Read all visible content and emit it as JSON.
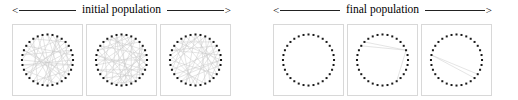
{
  "figure": {
    "width": 518,
    "height": 100,
    "background": "#ffffff",
    "node_color": "#1a1a1a",
    "edge_color": "#c9c9c9",
    "panel_border_color": "#d8d8d8",
    "rule_color": "#222222"
  },
  "groups": [
    {
      "id": "initial",
      "label": "initial population",
      "arrow_left": "<",
      "arrow_right": ">",
      "left": 12,
      "panels": [
        {
          "id": "initial-1",
          "node_count": 32,
          "edges": [
            [
              0,
              13
            ],
            [
              1,
              20
            ],
            [
              2,
              16
            ],
            [
              3,
              25
            ],
            [
              4,
              11
            ],
            [
              5,
              22
            ],
            [
              6,
              18
            ],
            [
              7,
              27
            ],
            [
              8,
              14
            ],
            [
              9,
              24
            ],
            [
              10,
              19
            ],
            [
              12,
              28
            ],
            [
              15,
              30
            ],
            [
              17,
              2
            ],
            [
              21,
              6
            ],
            [
              23,
              9
            ],
            [
              26,
              12
            ],
            [
              29,
              4
            ],
            [
              31,
              15
            ],
            [
              5,
              17
            ],
            [
              8,
              23
            ],
            [
              11,
              26
            ],
            [
              3,
              19
            ],
            [
              1,
              9
            ],
            [
              13,
              27
            ],
            [
              20,
              31
            ],
            [
              7,
              16
            ],
            [
              24,
              30
            ],
            [
              14,
              22
            ],
            [
              0,
              10
            ],
            [
              18,
              29
            ],
            [
              6,
              25
            ],
            [
              2,
              12
            ],
            [
              4,
              21
            ],
            [
              15,
              28
            ]
          ]
        },
        {
          "id": "initial-2",
          "node_count": 32,
          "edges": [
            [
              0,
              15
            ],
            [
              1,
              11
            ],
            [
              2,
              21
            ],
            [
              3,
              17
            ],
            [
              4,
              26
            ],
            [
              5,
              13
            ],
            [
              6,
              29
            ],
            [
              7,
              19
            ],
            [
              8,
              24
            ],
            [
              9,
              16
            ],
            [
              10,
              30
            ],
            [
              12,
              22
            ],
            [
              14,
              27
            ],
            [
              18,
              31
            ],
            [
              20,
              3
            ],
            [
              23,
              7
            ],
            [
              25,
              10
            ],
            [
              28,
              1
            ],
            [
              2,
              14
            ],
            [
              5,
              20
            ],
            [
              8,
              18
            ],
            [
              11,
              25
            ],
            [
              13,
              29
            ],
            [
              16,
              31
            ],
            [
              0,
              9
            ],
            [
              4,
              12
            ],
            [
              6,
              17
            ],
            [
              15,
              26
            ],
            [
              19,
              28
            ],
            [
              21,
              30
            ],
            [
              3,
              23
            ],
            [
              7,
              27
            ],
            [
              10,
              22
            ],
            [
              1,
              24
            ],
            [
              13,
              18
            ],
            [
              5,
              16
            ],
            [
              9,
              30
            ],
            [
              2,
              26
            ],
            [
              11,
              20
            ],
            [
              14,
              31
            ]
          ]
        },
        {
          "id": "initial-3",
          "node_count": 32,
          "edges": [
            [
              0,
              18
            ],
            [
              1,
              14
            ],
            [
              2,
              23
            ],
            [
              3,
              10
            ],
            [
              4,
              28
            ],
            [
              5,
              19
            ],
            [
              6,
              15
            ],
            [
              7,
              26
            ],
            [
              8,
              21
            ],
            [
              9,
              31
            ],
            [
              11,
              24
            ],
            [
              12,
              29
            ],
            [
              13,
              2
            ],
            [
              16,
              27
            ],
            [
              17,
              5
            ],
            [
              20,
              8
            ],
            [
              22,
              30
            ],
            [
              25,
              1
            ],
            [
              3,
              16
            ],
            [
              6,
              22
            ],
            [
              9,
              19
            ],
            [
              12,
              27
            ],
            [
              0,
              11
            ],
            [
              4,
              20
            ],
            [
              7,
              13
            ],
            [
              10,
              30
            ],
            [
              14,
              23
            ],
            [
              17,
              29
            ],
            [
              21,
              31
            ],
            [
              5,
              26
            ],
            [
              2,
              18
            ],
            [
              8,
              28
            ],
            [
              15,
              25
            ],
            [
              1,
              24
            ]
          ]
        }
      ]
    },
    {
      "id": "final",
      "label": "final population",
      "arrow_left": "<",
      "arrow_right": ">",
      "left": 273,
      "panels": [
        {
          "id": "final-1",
          "node_count": 32,
          "edges": []
        },
        {
          "id": "final-2",
          "node_count": 32,
          "edges": [
            [
              27,
              6
            ],
            [
              28,
              6
            ],
            [
              6,
              13
            ]
          ]
        },
        {
          "id": "final-3",
          "node_count": 32,
          "edges": [
            [
              25,
              12
            ],
            [
              25,
              11
            ]
          ]
        }
      ]
    }
  ]
}
